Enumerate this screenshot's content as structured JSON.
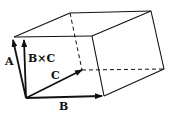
{
  "diagram": {
    "labels": {
      "a": "A",
      "bxc": "B×C",
      "c": "C",
      "b": "B"
    },
    "colors": {
      "stroke": "#111111",
      "background": "#ffffff"
    }
  }
}
